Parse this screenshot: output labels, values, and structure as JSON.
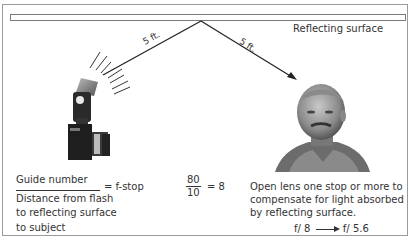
{
  "diagram": {
    "surface_label": "Reflecting surface",
    "distance_incident": "5 ft.",
    "distance_reflected": "5 ft.",
    "formula": {
      "numerator": "Guide number",
      "denominator": "Distance from flash to reflecting surface to subject",
      "equals": "= f-stop"
    },
    "example": {
      "numerator": "80",
      "denominator": "10",
      "result": "= 8"
    },
    "note": "Open lens one stop or more to compensate for light absorbed by reflecting surface.",
    "fstop_from": "f/ 8",
    "fstop_to": "f/ 5.6",
    "colors": {
      "line": "#222222",
      "frame": "#9a9a9a",
      "text": "#333333"
    },
    "icons": {
      "flash": "camera-with-flash-icon",
      "subject": "portrait-photo-icon"
    }
  }
}
